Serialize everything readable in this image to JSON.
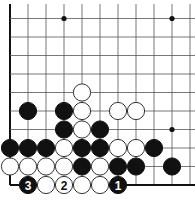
{
  "diagram": {
    "type": "go-board-partial",
    "origin": {
      "x": 10,
      "y": 18.5
    },
    "spacing": {
      "x": 18,
      "y": 18.5
    },
    "columns": 11,
    "rows": 10,
    "edges": {
      "left": true,
      "bottom": true,
      "top": false,
      "right": false
    },
    "star_points": [
      {
        "col": 3,
        "row": 0
      },
      {
        "col": 9,
        "row": 0
      },
      {
        "col": 9,
        "row": 6
      }
    ],
    "stones": [
      {
        "col": 4,
        "row": 4,
        "color": "white",
        "label": ""
      },
      {
        "col": 1,
        "row": 5,
        "color": "black",
        "label": ""
      },
      {
        "col": 3,
        "row": 5,
        "color": "black",
        "label": ""
      },
      {
        "col": 4,
        "row": 5,
        "color": "white",
        "label": ""
      },
      {
        "col": 6,
        "row": 5,
        "color": "white",
        "label": ""
      },
      {
        "col": 7,
        "row": 5,
        "color": "white",
        "label": ""
      },
      {
        "col": 3,
        "row": 6,
        "color": "black",
        "label": ""
      },
      {
        "col": 4,
        "row": 6,
        "color": "white",
        "label": ""
      },
      {
        "col": 5,
        "row": 6,
        "color": "black",
        "label": ""
      },
      {
        "col": 0,
        "row": 7,
        "color": "black",
        "label": ""
      },
      {
        "col": 1,
        "row": 7,
        "color": "black",
        "label": ""
      },
      {
        "col": 2,
        "row": 7,
        "color": "black",
        "label": ""
      },
      {
        "col": 3,
        "row": 7,
        "color": "white",
        "label": ""
      },
      {
        "col": 4,
        "row": 7,
        "color": "black",
        "label": ""
      },
      {
        "col": 5,
        "row": 7,
        "color": "black",
        "label": ""
      },
      {
        "col": 6,
        "row": 7,
        "color": "white",
        "label": ""
      },
      {
        "col": 7,
        "row": 7,
        "color": "white",
        "label": ""
      },
      {
        "col": 8,
        "row": 7,
        "color": "black",
        "label": ""
      },
      {
        "col": 0,
        "row": 8,
        "color": "white",
        "label": ""
      },
      {
        "col": 1,
        "row": 8,
        "color": "white",
        "label": ""
      },
      {
        "col": 2,
        "row": 8,
        "color": "white",
        "label": ""
      },
      {
        "col": 3,
        "row": 8,
        "color": "white",
        "label": ""
      },
      {
        "col": 4,
        "row": 8,
        "color": "black",
        "label": ""
      },
      {
        "col": 5,
        "row": 8,
        "color": "white",
        "label": ""
      },
      {
        "col": 6,
        "row": 8,
        "color": "black",
        "label": ""
      },
      {
        "col": 7,
        "row": 8,
        "color": "black",
        "label": ""
      },
      {
        "col": 9,
        "row": 8,
        "color": "black",
        "label": ""
      },
      {
        "col": 1,
        "row": 9,
        "color": "black",
        "label": "3"
      },
      {
        "col": 2,
        "row": 9,
        "color": "white",
        "label": ""
      },
      {
        "col": 3,
        "row": 9,
        "color": "white",
        "label": "2"
      },
      {
        "col": 4,
        "row": 9,
        "color": "white",
        "label": ""
      },
      {
        "col": 5,
        "row": 9,
        "color": "white",
        "label": ""
      },
      {
        "col": 6,
        "row": 9,
        "color": "black",
        "label": "1"
      }
    ],
    "colors": {
      "black": "#111111",
      "white": "#ffffff",
      "line": "#555555"
    }
  }
}
